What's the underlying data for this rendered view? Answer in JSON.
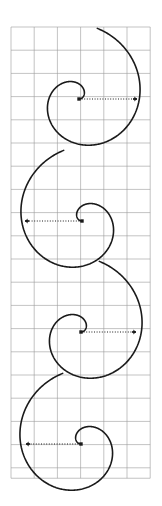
{
  "figure": {
    "title": "",
    "background_color": "#ffffff",
    "width": 162,
    "height": 506
  },
  "grid": {
    "name": "square-grid",
    "line_color": "#9a9a9a",
    "line_width": 0.6,
    "cell_size": 23.2,
    "x_start": 11,
    "y_start": 27,
    "columns": 6,
    "rows": 19.45,
    "visible": true
  },
  "chart_data": {
    "type": "line",
    "title": "",
    "subtitle": "",
    "xlabel": "",
    "ylabel": "",
    "xlim": [
      11,
      150
    ],
    "ylim": [
      27,
      478
    ],
    "grid": true,
    "legend": null,
    "stroke_color": "#1a1a1a",
    "stroke_width": 1.6,
    "marker_color": "#1a1a1a",
    "guide_style": "dotted",
    "series": [
      {
        "name": "spiral-1",
        "type": "archimedean-spiral",
        "center": [
          79,
          99
        ],
        "a": 0.0,
        "b": 9.6,
        "theta_start": 0.0,
        "theta_end": 7.6,
        "direction": "counterclockwise",
        "mirrored": false,
        "start_marker": "dot",
        "end_marker": "arrow-tick",
        "end_point": [
          137,
          99
        ],
        "guide_line": {
          "from": [
            79,
            99
          ],
          "to": [
            136,
            99
          ]
        }
      },
      {
        "name": "spiral-2",
        "type": "archimedean-spiral",
        "center": [
          82,
          221
        ],
        "a": 0.0,
        "b": 9.6,
        "theta_start": 0.0,
        "theta_end": 7.6,
        "direction": "clockwise",
        "mirrored": true,
        "start_marker": "dot",
        "end_marker": "arrow-tick",
        "end_point": [
          25,
          221
        ],
        "guide_line": {
          "from": [
            82,
            221
          ],
          "to": [
            26,
            221
          ]
        }
      },
      {
        "name": "spiral-3",
        "type": "archimedean-spiral",
        "center": [
          81,
          332
        ],
        "a": 0.0,
        "b": 9.6,
        "theta_start": 0.0,
        "theta_end": 7.6,
        "direction": "counterclockwise",
        "mirrored": false,
        "start_marker": "dot",
        "end_marker": "arrow-tick",
        "end_point": [
          136,
          332
        ],
        "guide_line": {
          "from": [
            81,
            332
          ],
          "to": [
            135,
            332
          ]
        }
      },
      {
        "name": "spiral-4",
        "type": "archimedean-spiral",
        "center": [
          81,
          444
        ],
        "a": 0.0,
        "b": 9.6,
        "theta_start": 0.0,
        "theta_end": 7.6,
        "direction": "clockwise",
        "mirrored": true,
        "start_marker": "dot",
        "end_marker": "arrow-tick",
        "end_point": [
          26,
          444
        ],
        "guide_line": {
          "from": [
            81,
            444
          ],
          "to": [
            27,
            444
          ]
        }
      }
    ]
  }
}
